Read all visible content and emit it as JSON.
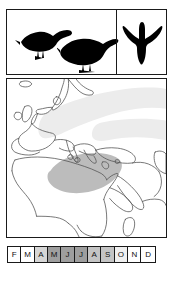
{
  "figure": {
    "kind": "species-distribution-figure",
    "background_color": "#ffffff",
    "border_color": "#1a1a1a"
  },
  "silhouette_panel": {
    "birds": [
      {
        "name": "perched-bird-1",
        "pose": "perched",
        "facing": "right",
        "fill": "#000000"
      },
      {
        "name": "perched-bird-2",
        "pose": "perched",
        "facing": "right",
        "fill": "#000000"
      }
    ],
    "flight_cell": {
      "bird": {
        "name": "flying-bird",
        "pose": "in-flight",
        "view": "from-below",
        "fill": "#000000"
      }
    }
  },
  "map": {
    "region": "Europe, Mediterranean, Africa and Middle East",
    "coastline_color": "#555555",
    "breeding_range": {
      "label": "breeding range",
      "color": "#ececec"
    },
    "wintering_range": {
      "label": "wintering range",
      "color": "#bcbcbc"
    }
  },
  "month_bar": {
    "months": [
      {
        "label": "F",
        "shade": "#ffffff"
      },
      {
        "label": "M",
        "shade": "#ffffff"
      },
      {
        "label": "A",
        "shade": "#d6d6d6"
      },
      {
        "label": "M",
        "shade": "#9e9e9e"
      },
      {
        "label": "J",
        "shade": "#9e9e9e"
      },
      {
        "label": "J",
        "shade": "#9e9e9e"
      },
      {
        "label": "A",
        "shade": "#c4c4c4"
      },
      {
        "label": "S",
        "shade": "#c4c4c4"
      },
      {
        "label": "O",
        "shade": "#efefef"
      },
      {
        "label": "N",
        "shade": "#ffffff"
      },
      {
        "label": "D",
        "shade": "#ffffff"
      }
    ]
  }
}
